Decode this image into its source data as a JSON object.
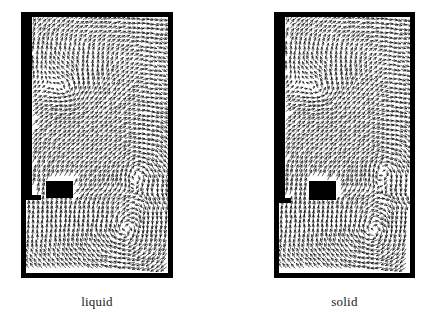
{
  "figure": {
    "background_color": "#ffffff",
    "width": 435,
    "height": 324,
    "ink_color": "#000000",
    "caption_color": "#1a1a1a"
  },
  "panels": [
    {
      "id": "liquid",
      "caption": "liquid",
      "frame": {
        "x": 21,
        "y": 12,
        "width": 152,
        "height": 266,
        "border": 5
      },
      "caption_pos": {
        "x": 21,
        "y": 294,
        "width": 152
      },
      "obstacle_block": {
        "x": 46,
        "y": 181,
        "width": 27,
        "height": 17
      },
      "wall_step": {
        "x": 21,
        "y": 12,
        "width": 11,
        "height": 183
      },
      "wall_notch": {
        "x": 21,
        "y": 195,
        "width": 20,
        "height": 5
      },
      "vortices": [
        {
          "name": "upper-right-vortex",
          "cx": 0.78,
          "cy": 0.6,
          "sense": "clockwise",
          "strength": 1.0
        },
        {
          "name": "lower-right-vortex",
          "cx": 0.7,
          "cy": 0.84,
          "sense": "clockwise",
          "strength": 1.0
        },
        {
          "name": "upper-left-updraft",
          "cx": 0.3,
          "cy": 0.3,
          "sense": "counterclockwise",
          "strength": 0.8
        }
      ],
      "jet": {
        "name": "horizontal-jet",
        "y": 0.705,
        "direction": "rightward"
      }
    },
    {
      "id": "solid",
      "caption": "solid",
      "frame": {
        "x": 274,
        "y": 12,
        "width": 141,
        "height": 266,
        "border": 5
      },
      "caption_pos": {
        "x": 274,
        "y": 294,
        "width": 141
      },
      "obstacle_block": {
        "x": 309,
        "y": 181,
        "width": 27,
        "height": 19
      },
      "wall_step": {
        "x": 274,
        "y": 12,
        "width": 11,
        "height": 186
      },
      "wall_notch": {
        "x": 274,
        "y": 198,
        "width": 17,
        "height": 5
      },
      "vortices": [
        {
          "name": "upper-right-vortex",
          "cx": 0.8,
          "cy": 0.58,
          "sense": "clockwise",
          "strength": 1.0
        },
        {
          "name": "lower-right-vortex",
          "cx": 0.72,
          "cy": 0.84,
          "sense": "clockwise",
          "strength": 1.0
        },
        {
          "name": "upper-left-updraft",
          "cx": 0.32,
          "cy": 0.3,
          "sense": "counterclockwise",
          "strength": 0.8
        }
      ],
      "jet": {
        "name": "horizontal-jet",
        "y": 0.705,
        "direction": "rightward"
      }
    }
  ],
  "chart_data": {
    "type": "scatter",
    "title": "",
    "xlabel": "",
    "ylabel": "",
    "panels": [
      "liquid",
      "solid"
    ],
    "legend_entries": [
      "liquid",
      "solid"
    ],
    "legend_position": "below-each-panel",
    "grid": false
  }
}
